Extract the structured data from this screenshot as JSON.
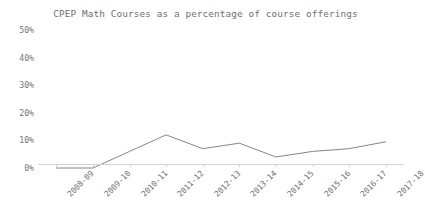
{
  "chart_data": {
    "type": "line",
    "title": "CPEP Math Courses as a percentage of course offerings",
    "xlabel": "",
    "ylabel": "",
    "categories": [
      "2008-09",
      "2009-10",
      "2010-11",
      "2011-12",
      "2012-13",
      "2013-14",
      "2014-15",
      "2015-16",
      "2016-17",
      "2017-18"
    ],
    "values": [
      0,
      0,
      6,
      12,
      7,
      9,
      4,
      6,
      7,
      9.5
    ],
    "ylim": [
      0,
      50
    ],
    "ytick_values": [
      0,
      10,
      20,
      30,
      40,
      50
    ],
    "ytick_labels": [
      "0%",
      "10%",
      "20%",
      "30%",
      "40%",
      "50%"
    ],
    "grid": false,
    "legend": false,
    "series": [
      {
        "name": "CPEP Math Courses",
        "values": [
          0,
          0,
          6,
          12,
          7,
          9,
          4,
          6,
          7,
          9.5
        ],
        "color": "#868686"
      }
    ],
    "line_color": "#868686",
    "axis_color": "#d4d4d4",
    "text_color": "#6f6f6f",
    "background_color": "#ffffff"
  }
}
